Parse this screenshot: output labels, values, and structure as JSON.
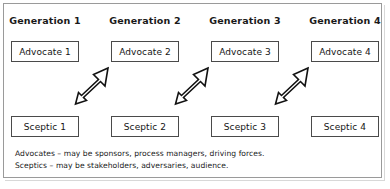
{
  "diagram": {
    "title_row": {
      "headers": [
        {
          "label": "Generation 1"
        },
        {
          "label": "Generation 2"
        },
        {
          "label": "Generation 3"
        },
        {
          "label": "Generation 4"
        }
      ]
    },
    "advocate_row": {
      "nodes": [
        {
          "label": "Advocate 1"
        },
        {
          "label": "Advocate 2"
        },
        {
          "label": "Advocate 3"
        },
        {
          "label": "Advocate 4"
        }
      ]
    },
    "sceptic_row": {
      "nodes": [
        {
          "label": "Sceptic 1"
        },
        {
          "label": "Sceptic 2"
        },
        {
          "label": "Sceptic 3"
        },
        {
          "label": "Sceptic 4"
        }
      ]
    },
    "arrows": [
      {
        "name": "arrow-gen1-sceptic-to-gen2-advocate",
        "direction": "up-right",
        "style": "outlined-block-arrow"
      },
      {
        "name": "arrow-gen2-sceptic-to-gen3-advocate",
        "direction": "up-right",
        "style": "outlined-block-arrow"
      },
      {
        "name": "arrow-gen3-sceptic-to-gen4-advocate",
        "direction": "up-right",
        "style": "outlined-block-arrow"
      }
    ],
    "caption": {
      "line1": "Advocates – may be sponsors, process managers, driving forces.",
      "line2": "Sceptics – may be stakeholders, adversaries, audience."
    },
    "colors": {
      "background": "#ffffff",
      "frame_border": "#9a9a9a",
      "box_border": "#4a4a4a",
      "text": "#1a1a1a",
      "arrow_stroke": "#111111",
      "arrow_fill": "#ffffff"
    }
  }
}
